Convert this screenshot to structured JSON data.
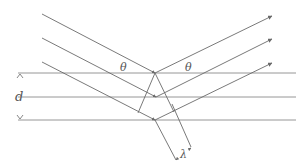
{
  "colors": {
    "plane": "#8a8a8a",
    "ray": "#6a6a6a",
    "label": "#555555",
    "background": "#ffffff"
  },
  "labels": {
    "theta_incident": "θ",
    "theta_reflected": "θ",
    "spacing": "d",
    "wavelength": "λ"
  },
  "planes": [
    {
      "id": "plane-1",
      "y": 73
    },
    {
      "id": "plane-2",
      "y": 97
    },
    {
      "id": "plane-3",
      "y": 120
    }
  ],
  "rays": [
    {
      "id": "ray-1",
      "start": [
        42,
        14
      ],
      "reflect": [
        155,
        73
      ],
      "end": [
        272,
        16
      ]
    },
    {
      "id": "ray-2",
      "start": [
        42,
        38
      ],
      "reflect": [
        156,
        97
      ],
      "end": [
        272,
        39
      ]
    },
    {
      "id": "ray-3",
      "start": [
        42,
        62
      ],
      "reflect": [
        155,
        120
      ],
      "end": [
        272,
        63
      ]
    }
  ]
}
